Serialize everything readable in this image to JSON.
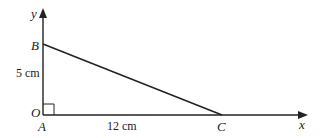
{
  "diagram": {
    "type": "right-triangle-on-axes",
    "axes": {
      "x_label": "x",
      "y_label": "y",
      "origin_label": "O"
    },
    "vertices": {
      "A": {
        "label": "A"
      },
      "B": {
        "label": "B"
      },
      "C": {
        "label": "C"
      }
    },
    "sides": {
      "AB": {
        "length_label": "5 cm"
      },
      "AC": {
        "length_label": "12 cm"
      }
    },
    "right_angle_at": "A",
    "stroke_color": "#222222"
  }
}
